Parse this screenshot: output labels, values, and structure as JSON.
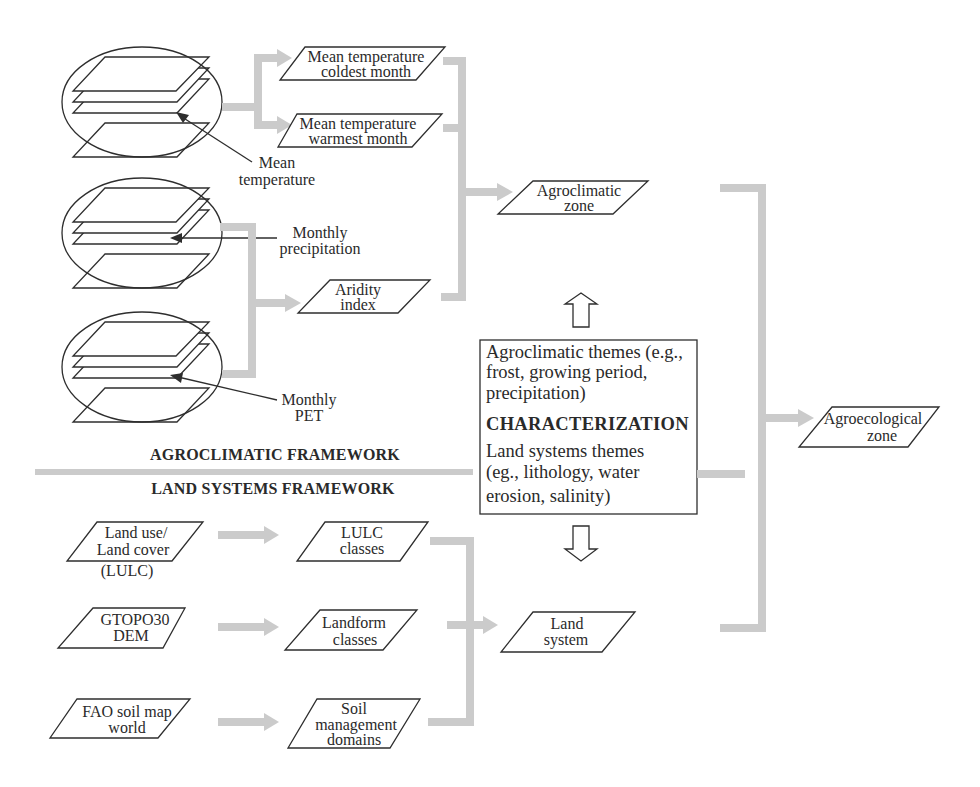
{
  "colors": {
    "connector": "#cbcbcb",
    "outline": "#2e2e2e",
    "text": "#2a2a2a",
    "background": "#ffffff"
  },
  "inputs": {
    "mean_temperature": {
      "label": [
        "Mean",
        "temperature"
      ],
      "icon": "raster-layer-stack-icon"
    },
    "monthly_precipitation": {
      "label": [
        "Monthly",
        "precipitation"
      ],
      "icon": "raster-layer-stack-icon"
    },
    "monthly_pet": {
      "label": [
        "Monthly",
        "PET"
      ],
      "icon": "raster-layer-stack-icon"
    }
  },
  "nodes": {
    "mean_temp_coldest": [
      "Mean temperature",
      "coldest month"
    ],
    "mean_temp_warmest": [
      "Mean temperature",
      "warmest month"
    ],
    "aridity_index": [
      "Aridity",
      "index"
    ],
    "agroclimatic_zone": [
      "Agroclimatic",
      "zone"
    ],
    "agroecological_zone": [
      "Agroecological",
      "zone"
    ],
    "land_use_cover": [
      "Land use/",
      "Land cover"
    ],
    "land_use_cover_note": "(LULC)",
    "gtopo30": [
      "GTOPO30",
      "DEM"
    ],
    "fao_soil": [
      "FAO soil map",
      "world"
    ],
    "lulc_classes": [
      "LULC",
      "classes"
    ],
    "landform_classes": [
      "Landform",
      "classes"
    ],
    "soil_domains": [
      "Soil",
      "management",
      "domains"
    ],
    "land_system": [
      "Land",
      "system"
    ]
  },
  "sections": {
    "agroclimatic": "AGROCLIMATIC FRAMEWORK",
    "land_systems": "LAND SYSTEMS FRAMEWORK"
  },
  "characterization_box": {
    "agroclimatic_themes": [
      "Agroclimatic themes (e.g.,",
      "frost, growing period,",
      "precipitation)"
    ],
    "title": "CHARACTERIZATION",
    "land_systems_themes": [
      "Land systems themes",
      "(eg., lithology, water",
      "erosion, salinity)"
    ]
  }
}
